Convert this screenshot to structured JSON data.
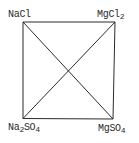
{
  "diagram": {
    "type": "reciprocal-salt-pair square",
    "corners": {
      "top_left": {
        "label": "NaCl",
        "base": "NaCl",
        "sub": "",
        "tail": ""
      },
      "top_right": {
        "label": "MgCl2",
        "base": "MgCl",
        "sub": "2",
        "tail": ""
      },
      "bottom_left": {
        "label": "Na2SO4",
        "base": "Na",
        "sub": "2",
        "tail": "SO",
        "sub2": "4"
      },
      "bottom_right": {
        "label": "MgSO4",
        "base": "MgSO",
        "sub": "4",
        "tail": ""
      }
    },
    "edges": [
      "NaCl-MgCl2",
      "MgCl2-MgSO4",
      "MgSO4-Na2SO4",
      "Na2SO4-NaCl"
    ],
    "diagonals": [
      "NaCl-MgSO4",
      "MgCl2-Na2SO4"
    ],
    "stroke_color": "#2a2a2a",
    "background": "#ffffff"
  }
}
